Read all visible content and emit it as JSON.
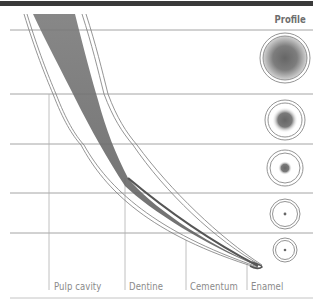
{
  "diagram": {
    "title": "Profile",
    "layers": [
      {
        "id": "pulp",
        "label": "Pulp cavity"
      },
      {
        "id": "dentine",
        "label": "Dentine"
      },
      {
        "id": "cementum",
        "label": "Cementum"
      },
      {
        "id": "enamel",
        "label": "Enamel"
      }
    ],
    "profiles": [
      {
        "level": 1,
        "core": "large"
      },
      {
        "level": 2,
        "core": "medium"
      },
      {
        "level": 3,
        "core": "small"
      },
      {
        "level": 4,
        "core": "dot"
      },
      {
        "level": 5,
        "core": "dot"
      }
    ],
    "colors": {
      "top_bar": "#3a3a3a",
      "grid_line": "#9a9a9a",
      "outline": "#7a7a7a",
      "pulp_fill": "#6f6f6f",
      "label_text": "#8a8a8a"
    }
  }
}
